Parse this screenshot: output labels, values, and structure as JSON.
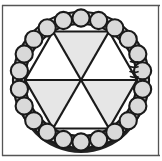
{
  "figure": {
    "name": "circular-cross-section-diagram",
    "frame": {
      "top_rule": true,
      "bottom_rule": true,
      "left_rule": true,
      "right_rule": true,
      "rule_color": "#555555"
    },
    "colors": {
      "outline": "#1a1a1a",
      "ring_cell_fill": "#d9d9d9",
      "segment_fill_light": "#e6e6e6",
      "segment_fill_white": "#ffffff",
      "shadow": "#000000",
      "background": "#ffffff"
    },
    "geometry": {
      "center_x": 81,
      "center_y": 80,
      "outer_radius": 69,
      "inner_radius": 55,
      "ring_cell_count": 22,
      "ring_cell_radius": 8.5,
      "segment_count": 6,
      "radial_line_count": 3,
      "squiggle_marks": 4
    },
    "segments": [
      {
        "label": "segment-top",
        "start_deg": -120,
        "end_deg": -60,
        "fill": "#e6e6e6"
      },
      {
        "label": "segment-upper-right",
        "start_deg": -60,
        "end_deg": 0,
        "fill": "#ffffff"
      },
      {
        "label": "segment-lower-right",
        "start_deg": 0,
        "end_deg": 60,
        "fill": "#e6e6e6"
      },
      {
        "label": "segment-bottom",
        "start_deg": 60,
        "end_deg": 120,
        "fill": "#ffffff"
      },
      {
        "label": "segment-lower-left",
        "start_deg": 120,
        "end_deg": 180,
        "fill": "#e6e6e6"
      },
      {
        "label": "segment-upper-left",
        "start_deg": 180,
        "end_deg": 240,
        "fill": "#ffffff"
      }
    ]
  }
}
